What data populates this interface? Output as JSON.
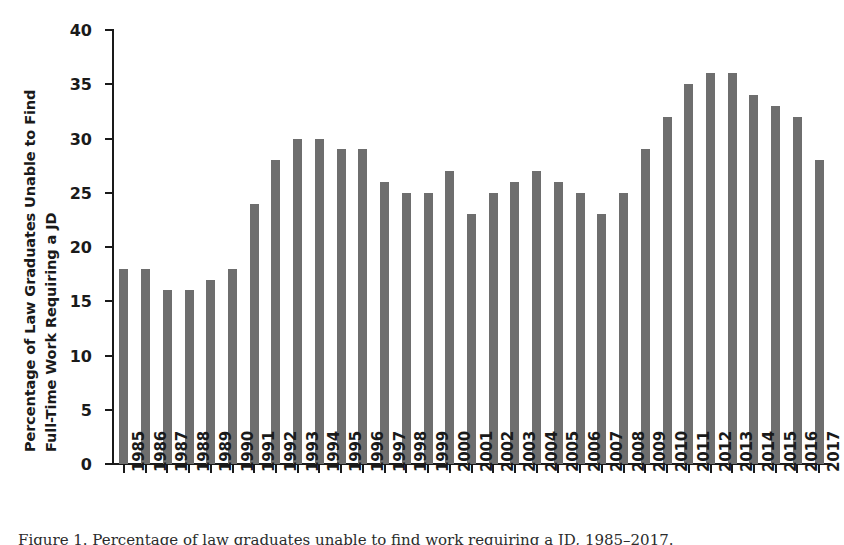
{
  "chart_data": {
    "type": "bar",
    "title": "",
    "subtitle": "",
    "xlabel": "",
    "ylabel": "Percentage of Law Graduates Unable to Find Full-Time Work Requiring a JD",
    "ylabel_lines": [
      "Percentage of Law Graduates Unable to Find",
      "Full-Time Work Requiring a JD"
    ],
    "ylim": [
      0,
      40
    ],
    "yticks": [
      0,
      5,
      10,
      15,
      20,
      25,
      30,
      35,
      40
    ],
    "ytick_labels": [
      "0",
      "5",
      "10",
      "15",
      "20",
      "25",
      "30",
      "35",
      "40"
    ],
    "grid": false,
    "legend": null,
    "bar_color": "#6e6e6e",
    "axis_color": "#1a1a1a",
    "background": "#ffffff",
    "categories": [
      "1985",
      "1986",
      "1987",
      "1988",
      "1989",
      "1990",
      "1991",
      "1992",
      "1993",
      "1994",
      "1995",
      "1996",
      "1997",
      "1998",
      "1999",
      "2000",
      "2001",
      "2002",
      "2003",
      "2004",
      "2005",
      "2006",
      "2007",
      "2008",
      "2009",
      "2010",
      "2011",
      "2012",
      "2013",
      "2014",
      "2015",
      "2016",
      "2017"
    ],
    "values": [
      18,
      18,
      16,
      16,
      17,
      18,
      24,
      28,
      30,
      30,
      29,
      29,
      26,
      25,
      25,
      27,
      23,
      25,
      26,
      27,
      26,
      25,
      23,
      25,
      29,
      32,
      35,
      36,
      36,
      34,
      33,
      32,
      28
    ]
  },
  "caption": {
    "text": "Figure 1.  Percentage of law graduates unable to find work requiring a JD, 1985–2017."
  }
}
